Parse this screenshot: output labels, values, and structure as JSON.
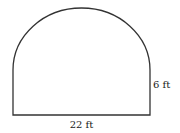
{
  "diagram": {
    "title": "",
    "shape": "rectangle topped by semicircle",
    "labels": {
      "width": "22 ft",
      "height": "6 ft"
    },
    "stroke_color": "#333333",
    "background_color": "#ffffff"
  }
}
